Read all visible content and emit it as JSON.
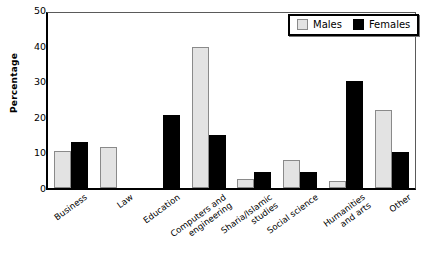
{
  "chart_data": {
    "type": "bar",
    "title": "",
    "xlabel": "",
    "ylabel": "Percentage",
    "ylim": [
      0,
      50
    ],
    "yticks": [
      0,
      10,
      20,
      30,
      40,
      50
    ],
    "grid": false,
    "legend_position": "top-right",
    "categories": [
      "Business",
      "Law",
      "Education",
      "Computers and engineering",
      "Sharia/Islamic studies",
      "Social science",
      "Humanities and arts",
      "Other"
    ],
    "category_lines": [
      [
        "Business"
      ],
      [
        "Law"
      ],
      [
        "Education"
      ],
      [
        "Computers and",
        "engineering"
      ],
      [
        "Sharia/Islamic",
        "studies"
      ],
      [
        "Social science"
      ],
      [
        "Humanities",
        "and arts"
      ],
      [
        "Other"
      ]
    ],
    "series": [
      {
        "name": "Males",
        "color": "#e3e3e3",
        "values": [
          10.5,
          11.5,
          0,
          39.5,
          2.5,
          8,
          2,
          22
        ]
      },
      {
        "name": "Females",
        "color": "#000000",
        "values": [
          13,
          0,
          20.5,
          15,
          4.5,
          4.5,
          30,
          10
        ]
      }
    ]
  },
  "legend": {
    "items": [
      {
        "label": "Males"
      },
      {
        "label": "Females"
      }
    ]
  },
  "axis": {
    "y_label": "Percentage",
    "y_tick_labels": [
      "50",
      "40",
      "30",
      "20",
      "10",
      "0"
    ]
  }
}
